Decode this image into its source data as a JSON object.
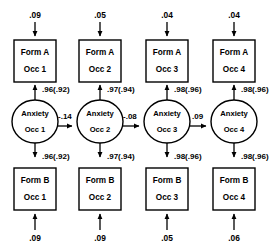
{
  "diagram": {
    "type": "structural-equation-path-diagram",
    "title": "",
    "colors": {
      "stroke": "#000000",
      "fill": "#ffffff",
      "background": "#ffffff"
    },
    "columns": [
      {
        "occasion": "Occ 1",
        "top_residual": ".09",
        "bottom_residual": ".09",
        "top_indicator_line1": "Form A",
        "top_indicator_line2": "Occ 1",
        "latent_line1": "Anxiety",
        "latent_line2": "Occ 1",
        "bottom_indicator_line1": "Form B",
        "bottom_indicator_line2": "Occ 1",
        "top_loading": ".96(.92)",
        "bottom_loading": ".96(.92)"
      },
      {
        "occasion": "Occ 2",
        "top_residual": ".05",
        "bottom_residual": ".09",
        "top_indicator_line1": "Form A",
        "top_indicator_line2": "Occ 2",
        "latent_line1": "Anxiety",
        "latent_line2": "Occ 2",
        "bottom_indicator_line1": "Form B",
        "bottom_indicator_line2": "Occ 2",
        "top_loading": ".97(.94)",
        "bottom_loading": ".97(.94)"
      },
      {
        "occasion": "Occ 3",
        "top_residual": ".04",
        "bottom_residual": ".05",
        "top_indicator_line1": "Form A",
        "top_indicator_line2": "Occ 3",
        "latent_line1": "Anxiety",
        "latent_line2": "Occ 3",
        "bottom_indicator_line1": "Form B",
        "bottom_indicator_line2": "Occ 3",
        "top_loading": ".98(.96)",
        "bottom_loading": ".98(.96)"
      },
      {
        "occasion": "Occ 4",
        "top_residual": ".04",
        "bottom_residual": ".06",
        "top_indicator_line1": "Form A",
        "top_indicator_line2": "Occ 4",
        "latent_line1": "Anxiety",
        "latent_line2": "Occ 4",
        "bottom_indicator_line1": "Form B",
        "bottom_indicator_line2": "Occ 4",
        "top_loading": ".98(.96)",
        "bottom_loading": ".98(.96)"
      }
    ],
    "structural_paths": [
      {
        "from": "Anxiety Occ 1",
        "to": "Anxiety Occ 2",
        "coefficient": "-.14"
      },
      {
        "from": "Anxiety Occ 2",
        "to": "Anxiety Occ 3",
        "coefficient": "-.08"
      },
      {
        "from": "Anxiety Occ 3",
        "to": "Anxiety Occ 4",
        "coefficient": ".09"
      }
    ]
  }
}
